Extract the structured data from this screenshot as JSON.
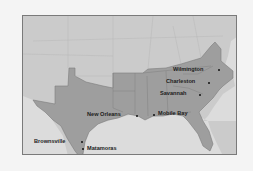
{
  "map": {
    "title": "Confederate ports",
    "colors": {
      "background": "#f4f4f4",
      "water": "#dcdcdc",
      "union_land": "#cbcbcb",
      "confederate_land": "#9e9e9e",
      "border_lines": "#8a8a8a",
      "frame": "#7a7a7a",
      "label": "#1c1c1c"
    },
    "places": [
      {
        "name": "Wilmington",
        "label": "Wilmington"
      },
      {
        "name": "Charleston",
        "label": "Charleston"
      },
      {
        "name": "Savannah",
        "label": "Savannah"
      },
      {
        "name": "New Orleans",
        "label": "New Orleans"
      },
      {
        "name": "Mobile Bay",
        "label": "Mobile Bay"
      },
      {
        "name": "Brownsville",
        "label": "Brownsville"
      },
      {
        "name": "Matamoras",
        "label": "Matamoras"
      }
    ]
  }
}
